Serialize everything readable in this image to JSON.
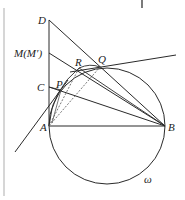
{
  "diagram": {
    "type": "geometry",
    "labels": {
      "D": "D",
      "M": "M(M′)",
      "C": "C",
      "P": "P",
      "R": "R",
      "Q": "Q",
      "A": "A",
      "B": "B",
      "omega": "ω"
    },
    "points": {
      "A": [
        49,
        126
      ],
      "B": [
        165,
        126
      ],
      "C": [
        49,
        87
      ],
      "M": [
        49,
        53
      ],
      "D": [
        49,
        20
      ],
      "P": [
        61,
        90
      ],
      "R": [
        79,
        68
      ],
      "Q": [
        100,
        67
      ]
    },
    "circle": {
      "center": [
        107,
        126
      ],
      "radius": 58
    },
    "colors": {
      "stroke": "#2a2a2a",
      "border": "#c8c8c8"
    }
  }
}
